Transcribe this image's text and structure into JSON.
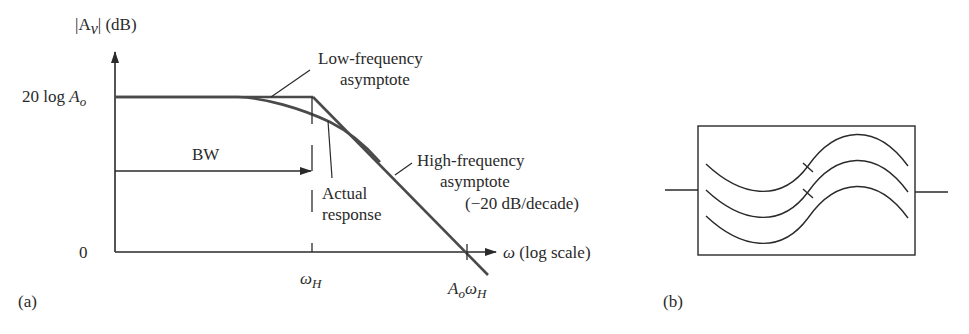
{
  "figure_a": {
    "y_axis_label_main": "|A",
    "y_axis_label_sub": "v",
    "y_axis_label_unit": "| (dB)",
    "y_tick_top_prefix": "20 log ",
    "y_tick_top_var": "A",
    "y_tick_top_sub": "o",
    "y_tick_zero": "0",
    "x_axis_label_var": "ω",
    "x_axis_label_rest": " (log scale)",
    "x_tick_wh_var": "ω",
    "x_tick_wh_sub": "H",
    "x_tick_aowh_var1": "A",
    "x_tick_aowh_sub1": "o",
    "x_tick_aowh_var2": "ω",
    "x_tick_aowh_sub2": "H",
    "bw_label": "BW",
    "low_freq_line1": "Low-frequency",
    "low_freq_line2": "asymptote",
    "high_freq_line1": "High-frequency",
    "high_freq_line2": "asymptote",
    "high_freq_line3": "(−20 dB/decade)",
    "actual_line1": "Actual",
    "actual_line2": "response",
    "panel_label": "(a)"
  },
  "figure_b": {
    "panel_label": "(b)"
  },
  "colors": {
    "ink": "#2a2a2a",
    "curve": "#4a4a4a",
    "background": "#ffffff"
  }
}
